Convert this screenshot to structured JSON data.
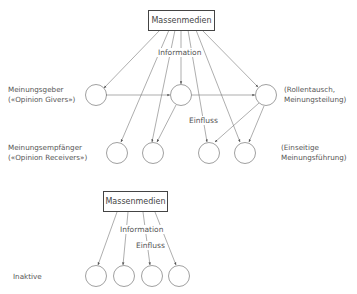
{
  "diagram": {
    "top": {
      "source_box": "Massenmedien",
      "info_label": "Information",
      "influence_label": "Einfluss",
      "row1_left_label": [
        "Meinungsgeber",
        "(«Opinion Givers»)"
      ],
      "row1_right_label": [
        "(Rollentausch,",
        "Meinungsteilung)"
      ],
      "row2_left_label": [
        "Meinungsempfänger",
        "(«Opinion Receivers»)"
      ],
      "row2_right_label": [
        "(Einseitige",
        "Meinungsführung)"
      ]
    },
    "bottom": {
      "source_box": "Massenmedien",
      "info_label": "Information",
      "influence_label": "Einfluss",
      "row_label": "Inaktive"
    }
  }
}
